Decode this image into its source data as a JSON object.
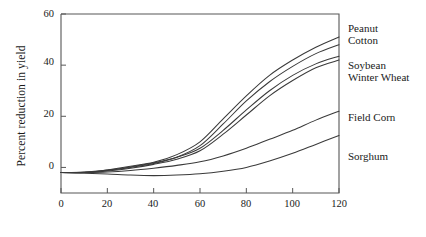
{
  "chart_data": {
    "type": "line",
    "title": "",
    "xlabel": "",
    "ylabel": "Percent reduction in yield",
    "xlim": [
      0,
      120
    ],
    "ylim": [
      -10,
      60
    ],
    "xticks": [
      0,
      20,
      40,
      60,
      80,
      100,
      120
    ],
    "yticks": [
      0,
      20,
      40,
      60
    ],
    "grid": false,
    "legend_position": "right-of-axes",
    "x": [
      0,
      10,
      20,
      30,
      40,
      50,
      60,
      70,
      80,
      90,
      100,
      110,
      120
    ],
    "series": [
      {
        "name": "Peanut",
        "label": "Peanut",
        "values": [
          -2,
          -2,
          -1,
          0.5,
          2,
          5,
          10,
          19,
          28,
          36,
          42,
          47,
          51
        ]
      },
      {
        "name": "Cotton",
        "label": "Cotton",
        "values": [
          -2,
          -2,
          -1.2,
          0,
          1.5,
          4,
          8.5,
          17,
          26,
          33.5,
          39.5,
          44.5,
          48
        ]
      },
      {
        "name": "Soybean",
        "label": "Soybean",
        "values": [
          -2,
          -1.8,
          -1,
          0.2,
          1.8,
          4,
          7.5,
          14.5,
          22.5,
          30,
          36,
          40.5,
          43.5
        ]
      },
      {
        "name": "Winter Wheat",
        "label": "Winter Wheat",
        "values": [
          -2,
          -1.9,
          -1.4,
          -0.3,
          1.2,
          3.2,
          6.5,
          13,
          20.5,
          28,
          34,
          39,
          42
        ]
      },
      {
        "name": "Field Corn",
        "label": "Field Corn",
        "values": [
          -2,
          -2,
          -1.8,
          -1.2,
          -0.3,
          0.8,
          2.2,
          4.5,
          7.5,
          11,
          14.5,
          18.5,
          22
        ]
      },
      {
        "name": "Sorghum",
        "label": "Sorghum",
        "values": [
          -2,
          -2.3,
          -2.6,
          -3,
          -3.2,
          -3,
          -2.5,
          -1.5,
          0,
          2.5,
          5.5,
          9,
          12.5
        ]
      }
    ],
    "series_labels": [
      {
        "text": "Peanut",
        "x": 348,
        "y": 22
      },
      {
        "text": "Cotton",
        "x": 348,
        "y": 34
      },
      {
        "text": "Soybean",
        "x": 348,
        "y": 59
      },
      {
        "text": "Winter Wheat",
        "x": 348,
        "y": 71
      },
      {
        "text": "Field Corn",
        "x": 348,
        "y": 111
      },
      {
        "text": "Sorghum",
        "x": 348,
        "y": 150
      }
    ]
  },
  "axes": {
    "y_axis_title": "Percent reduction in yield",
    "y_tick_labels": [
      "60",
      "40",
      "20",
      "0"
    ],
    "x_tick_labels": [
      "0",
      "20",
      "40",
      "60",
      "80",
      "100",
      "120"
    ]
  }
}
